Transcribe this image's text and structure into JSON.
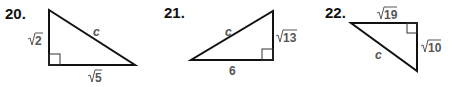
{
  "problems": [
    {
      "number": "20.",
      "side_a": {
        "radicand": "2",
        "position": "left-vertical"
      },
      "side_b": {
        "radicand": "5",
        "position": "bottom"
      },
      "hypotenuse": "c",
      "right_angle": "bottom-left"
    },
    {
      "number": "21.",
      "side_a": {
        "value": "6",
        "position": "bottom"
      },
      "side_b": {
        "radicand": "13",
        "position": "right-vertical"
      },
      "hypotenuse": "c",
      "right_angle": "bottom-right"
    },
    {
      "number": "22.",
      "side_a": {
        "radicand": "19",
        "position": "top"
      },
      "side_b": {
        "radicand": "10",
        "position": "right-vertical"
      },
      "hypotenuse": "c",
      "right_angle": "top-right"
    }
  ]
}
